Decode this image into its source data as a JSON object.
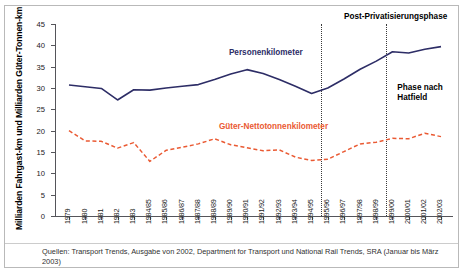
{
  "figure": {
    "y_axis_label": "Milliarden Fahrgast-km und Milliarden Güter-Tonnen-km",
    "source": "Quellen: Transport Trends, Ausgabe von 2002, Department for Transport und National Rail Trends, SRA (Januar bis März 2003)"
  },
  "annotations": {
    "passenger_label": "Personenkilometer",
    "freight_label": "Güter-Nettotonnenkilometer",
    "post_privatisation": "Post-Privatisierungsphase",
    "hatfield": "Phase nach\nHatfield",
    "hatfield_line1": "Phase nach",
    "hatfield_line2": "Hatfield"
  },
  "colors": {
    "passenger": "#2d2d66",
    "freight": "#ea5a33",
    "axis": "#55555a",
    "gridline": "#3a3a3a"
  },
  "chart_data": {
    "type": "line",
    "title": "",
    "xlabel": "",
    "ylabel": "Milliarden Fahrgast-km und Milliarden Güter-Tonnen-km",
    "ylim": [
      0,
      45
    ],
    "yticks": [
      0,
      5,
      10,
      15,
      20,
      25,
      30,
      35,
      40,
      45
    ],
    "grid": false,
    "legend_position": "inline-labels",
    "categories": [
      "1979",
      "1980",
      "1981",
      "1982",
      "1983",
      "1984/85",
      "1985/86",
      "1986/87",
      "1987/88",
      "1988/89",
      "1989/90",
      "1990/91",
      "1991/92",
      "1992/93",
      "1993/94",
      "1994/95",
      "1995/96",
      "1996/97",
      "1997/98",
      "1998/99",
      "1999/00",
      "2000/01",
      "2001/02",
      "2002/03"
    ],
    "series": [
      {
        "name": "Personenkilometer",
        "color": "#2d2d66",
        "style": "solid",
        "values": [
          30.7,
          30.3,
          29.9,
          27.2,
          29.6,
          29.5,
          30.0,
          30.4,
          30.8,
          32.0,
          33.3,
          34.3,
          33.4,
          32.0,
          30.4,
          28.7,
          30.0,
          32.1,
          34.4,
          36.3,
          38.5,
          38.2,
          39.1,
          39.7
        ]
      },
      {
        "name": "Güter-Nettotonnenkilometer",
        "color": "#ea5a33",
        "style": "dashed",
        "values": [
          20.0,
          17.6,
          17.5,
          15.9,
          17.2,
          12.8,
          15.4,
          16.1,
          16.9,
          18.1,
          16.7,
          16.0,
          15.3,
          15.5,
          13.8,
          13.0,
          13.3,
          15.1,
          16.9,
          17.3,
          18.2,
          18.1,
          19.4,
          18.6
        ]
      }
    ],
    "vertical_markers": [
      {
        "label": "Privatisierung",
        "at_index": 15.6
      },
      {
        "label": "Hatfield",
        "at_index": 19.6
      }
    ]
  }
}
